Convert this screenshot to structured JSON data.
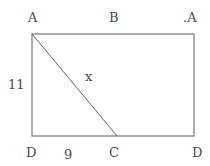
{
  "diagram": {
    "type": "rectangle with diagonal",
    "labels": {
      "top_left": "A",
      "top_middle": "B",
      "top_right": ".A",
      "bottom_left": "D",
      "bottom_middle": "C",
      "bottom_right": "D",
      "side_length": "11",
      "bottom_segment": "9",
      "diagonal": "x"
    },
    "colors": {
      "line": "#777777",
      "diagonal": "#666666",
      "text": "#4a4a4a"
    }
  }
}
